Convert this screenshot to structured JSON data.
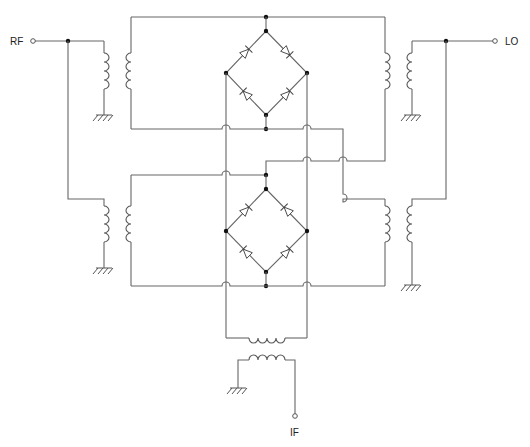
{
  "diagram": {
    "type": "double-balanced diode ring mixer schematic",
    "ports": {
      "rf": {
        "label": "RF"
      },
      "lo": {
        "label": "LO"
      },
      "if": {
        "label": "IF"
      }
    },
    "components": {
      "transformers": [
        "rf-upper",
        "rf-lower",
        "lo-upper",
        "lo-lower",
        "if-output"
      ],
      "diode_bridges": 2,
      "diodes_per_bridge": 4,
      "ground_symbols": 5
    },
    "colors": {
      "wire": "#666666",
      "junction": "#111111",
      "background": "#ffffff"
    }
  }
}
